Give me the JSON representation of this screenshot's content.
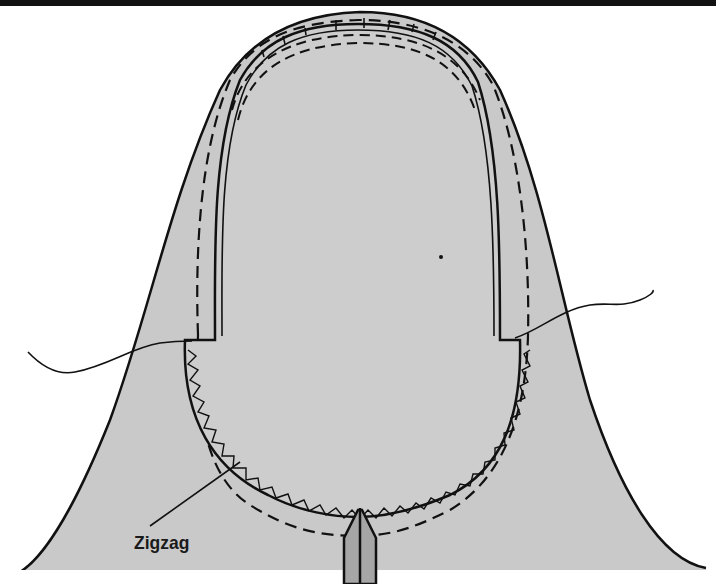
{
  "diagram": {
    "colors": {
      "fabric": "#c8c8c8",
      "neck_opening": "#cfcfcf",
      "outline": "#111111",
      "background": "#ffffff",
      "top_bar": "#111111",
      "placket": "#a6a6a6"
    },
    "labels": {
      "zigzag": "Zigzag"
    },
    "elements": [
      "bell-shaped fabric piece",
      "oval neck opening with double stitched edge",
      "inner dashed stitching line",
      "outer dashed stitching line",
      "zigzag stitching around lower curve",
      "left thread tail",
      "right thread tail",
      "center front placket",
      "leader line to zigzag label"
    ]
  }
}
